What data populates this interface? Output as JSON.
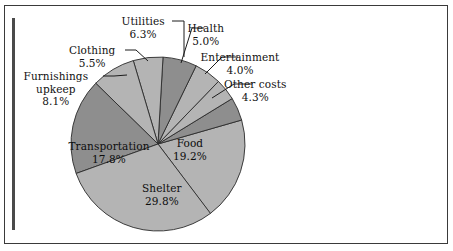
{
  "chart_data": {
    "type": "pie",
    "title": "",
    "subtitle": "",
    "xlabel": "",
    "ylabel": "",
    "legend_position": "none",
    "grid": false,
    "total_percent": 100.0,
    "start_angle_deg": -16,
    "direction": "clockwise",
    "categories": [
      "Food",
      "Other costs",
      "Entertainment",
      "Health",
      "Utilities",
      "Clothing",
      "Furnishings upkeep",
      "Transportation",
      "Shelter"
    ],
    "values": [
      19.2,
      4.3,
      4.0,
      5.0,
      6.3,
      5.5,
      8.1,
      17.8,
      29.8
    ],
    "slices": [
      {
        "name": "Food",
        "value": 19.2,
        "pct_text": "19.2%",
        "color": "#b4b4b4",
        "label_style": "inner",
        "label_x": 190,
        "label_y": 137,
        "start_deg": -16,
        "end_deg": 53.1
      },
      {
        "name": "Other costs",
        "value": 4.3,
        "pct_text": "4.3%",
        "color": "#8e8e8e",
        "label_style": "callout",
        "label_x": 255,
        "label_y": 78,
        "leader": [
          [
            252,
            84
          ],
          [
            234,
            84
          ],
          [
            212,
            98
          ]
        ],
        "start_deg": -31.5,
        "end_deg": -16
      },
      {
        "name": "Entertainment",
        "value": 4.0,
        "pct_text": "4.0%",
        "color": "#b4b4b4",
        "label_style": "callout",
        "label_x": 240,
        "label_y": 51,
        "leader": [
          [
            238,
            57
          ],
          [
            222,
            57
          ],
          [
            205,
            74
          ]
        ],
        "start_deg": -46.0,
        "end_deg": -31.5
      },
      {
        "name": "Health",
        "value": 5.0,
        "pct_text": "5.0%",
        "color": "#b4b4b4",
        "label_style": "callout",
        "label_x": 206,
        "label_y": 22,
        "leader": [
          [
            204,
            28
          ],
          [
            192,
            28
          ],
          [
            181,
            63
          ]
        ],
        "start_deg": -64.0,
        "end_deg": -46.0
      },
      {
        "name": "Utilities",
        "value": 6.3,
        "pct_text": "6.3%",
        "color": "#8e8e8e",
        "label_style": "callout",
        "label_x": 143,
        "label_y": 15,
        "leader": [
          [
            172,
            21
          ],
          [
            184,
            21
          ],
          [
            184,
            57
          ]
        ],
        "start_deg": -86.7,
        "end_deg": -64.0
      },
      {
        "name": "Clothing",
        "value": 5.5,
        "pct_text": "5.5%",
        "color": "#b4b4b4",
        "label_style": "callout",
        "label_x": 92,
        "label_y": 44,
        "leader": [
          [
            125,
            50
          ],
          [
            136,
            50
          ],
          [
            148,
            61
          ]
        ],
        "start_deg": -106.5,
        "end_deg": -86.7
      },
      {
        "name": "Furnishings upkeep",
        "value": 8.1,
        "pct_text": "8.1%",
        "color": "#b4b4b4",
        "label_style": "callout",
        "label_x": 56,
        "label_y": 70,
        "leader": [
          [
            103,
            76
          ],
          [
            114,
            76
          ],
          [
            127,
            75
          ]
        ],
        "start_deg": -135.7,
        "end_deg": -106.5
      },
      {
        "name": "Transportation",
        "value": 17.8,
        "pct_text": "17.8%",
        "color": "#8e8e8e",
        "label_style": "inner",
        "label_x": 109,
        "label_y": 140,
        "start_deg": -199.8,
        "end_deg": -135.7
      },
      {
        "name": "Shelter",
        "value": 29.8,
        "pct_text": "29.8%",
        "color": "#b4b4b4",
        "label_style": "inner",
        "label_x": 162,
        "label_y": 182,
        "start_deg": -307.1,
        "end_deg": -199.8
      }
    ],
    "geometry": {
      "center_x": 158,
      "center_y": 144,
      "radius": 87
    },
    "colors": {
      "light_gray": "#b4b4b4",
      "dark_gray": "#8e8e8e",
      "outline": "#2b2b2b",
      "frame": "#3a3a3a",
      "background": "#ffffff",
      "text": "#111111"
    }
  }
}
